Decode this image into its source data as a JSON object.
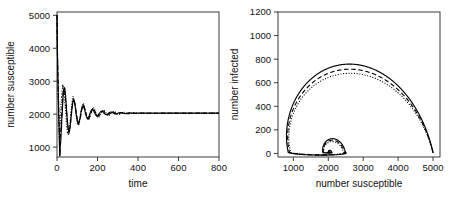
{
  "figure": {
    "background": "#ffffff",
    "ink": "#000000",
    "frame_color": "#3a3a3a"
  },
  "chart_data": [
    {
      "type": "line",
      "panel": "left",
      "title": "",
      "xlabel": "time",
      "ylabel": "number susceptible",
      "xlim": [
        0,
        800
      ],
      "ylim": [
        700,
        5100
      ],
      "xticks": [
        0,
        200,
        400,
        600,
        800
      ],
      "yticks": [
        1000,
        2000,
        3000,
        4000,
        5000
      ],
      "xtick_labels": [
        "0",
        "200",
        "400",
        "600",
        "800"
      ],
      "ytick_labels": [
        "1000",
        "2000",
        "3000",
        "4000",
        "5000"
      ],
      "grid": false,
      "legend": "none",
      "equilibrium": 2030,
      "initial_value": 5000,
      "first_minimum": 720,
      "series": [
        {
          "name": "solid",
          "style": "solid",
          "description": "damped oscillation of susceptibles converging to equilibrium",
          "model": {
            "start": 5000,
            "trough": 720,
            "trough_time": 14,
            "equilibrium": 2030,
            "amplitude": 1050,
            "period": 46,
            "damping": 72,
            "phase": 0.0,
            "noise": 0.055
          }
        },
        {
          "name": "dashed",
          "style": "dashed",
          "description": "stochastic variant, slightly lagged oscillation",
          "model": {
            "start": 5000,
            "trough": 760,
            "trough_time": 15,
            "equilibrium": 2030,
            "amplitude": 930,
            "period": 48,
            "damping": 80,
            "phase": 0.45,
            "noise": 0.07
          }
        },
        {
          "name": "dotted",
          "style": "dotted",
          "description": "stochastic variant, larger late-time fluctuation",
          "model": {
            "start": 5000,
            "trough": 690,
            "trough_time": 13,
            "equilibrium": 2030,
            "amplitude": 990,
            "period": 50,
            "damping": 92,
            "phase": 0.95,
            "noise": 0.09
          }
        }
      ]
    },
    {
      "type": "line",
      "panel": "right",
      "title": "",
      "xlabel": "number susceptible",
      "ylabel": "number infected",
      "xlim": [
        560,
        5200
      ],
      "ylim": [
        -30,
        1200
      ],
      "xticks": [
        1000,
        2000,
        3000,
        4000,
        5000
      ],
      "yticks": [
        0,
        200,
        400,
        600,
        800,
        1000,
        1200
      ],
      "xtick_labels": [
        "1000",
        "2000",
        "3000",
        "4000",
        "5000"
      ],
      "ytick_labels": [
        "0",
        "200",
        "400",
        "600",
        "800",
        "1000",
        "1200"
      ],
      "grid": false,
      "legend": "none",
      "fixed_point": [
        2030,
        8
      ],
      "start_point": [
        5000,
        1
      ],
      "description": "phase-plane spiral from (5000,0) through a large first loop peaking near 1150 infected at about 2050 susceptible, then spiralling inward to the endemic fixed point near (2030, 0)",
      "series": [
        {
          "name": "solid",
          "style": "solid",
          "model": {
            "center_x": 2030,
            "center_y": 8,
            "start_x": 5000,
            "peak_y": 1150,
            "peak_x": 2050,
            "left_x": 700,
            "decay": 0.295,
            "turns": 3.6,
            "squash": 0.62,
            "noise": 0.0
          }
        },
        {
          "name": "dashed",
          "style": "dashed",
          "model": {
            "center_x": 2030,
            "center_y": 8,
            "start_x": 5000,
            "peak_y": 1098,
            "peak_x": 2080,
            "left_x": 735,
            "decay": 0.305,
            "turns": 3.6,
            "squash": 0.62,
            "noise": 0.0
          }
        },
        {
          "name": "dotted",
          "style": "dotted",
          "model": {
            "center_x": 2030,
            "center_y": 8,
            "start_x": 5000,
            "peak_y": 1058,
            "peak_x": 2110,
            "left_x": 760,
            "decay": 0.315,
            "turns": 3.6,
            "squash": 0.62,
            "noise": 0.0
          }
        }
      ]
    }
  ]
}
